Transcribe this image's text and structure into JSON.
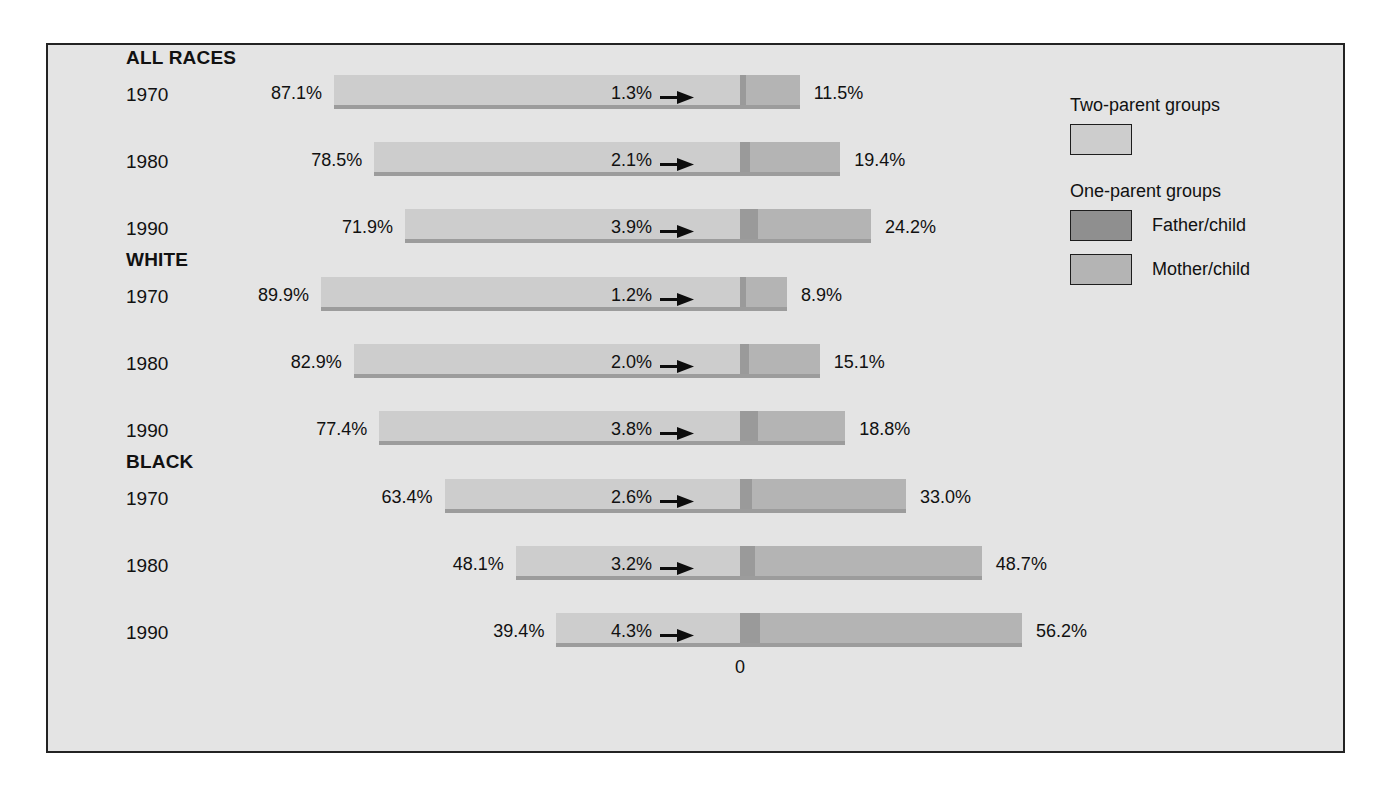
{
  "chart_data": {
    "type": "bar",
    "subtype": "diverging-stacked-horizontal",
    "title": "",
    "xlabel": "",
    "ylabel": "",
    "zero_axis_label": "0",
    "axis_origin_note": "Bars diverge from a common zero line; two-parent share extends left, one-parent share extends right.",
    "legend": {
      "position": "right",
      "groups": [
        {
          "title": "Two-parent groups",
          "entries": [
            {
              "label": "",
              "color": "#cdcdcd",
              "swatch_only": true
            }
          ]
        },
        {
          "title": "One-parent groups",
          "entries": [
            {
              "label": "Father/child",
              "color": "#8f8f8f"
            },
            {
              "label": "Mother/child",
              "color": "#b4b4b4"
            }
          ]
        }
      ]
    },
    "colors": {
      "two_parent": "#cdcdcd",
      "father_child": "#9a9a9a",
      "mother_child": "#b4b4b4",
      "background": "#e4e4e4",
      "frame": "#232323",
      "text": "#111111",
      "bar_shadow": "#9c9c9c"
    },
    "series": [
      {
        "name": "Two-parent groups",
        "color": "#cdcdcd"
      },
      {
        "name": "Father/child",
        "color": "#9a9a9a"
      },
      {
        "name": "Mother/child",
        "color": "#b4b4b4"
      }
    ],
    "groups": [
      {
        "name": "ALL RACES",
        "rows": [
          {
            "year": "1970",
            "two_parent": 87.1,
            "father_child": 1.3,
            "mother_child": 11.5,
            "two_parent_label": "87.1%",
            "father_child_label": "1.3%",
            "mother_child_label": "11.5%"
          },
          {
            "year": "1980",
            "two_parent": 78.5,
            "father_child": 2.1,
            "mother_child": 19.4,
            "two_parent_label": "78.5%",
            "father_child_label": "2.1%",
            "mother_child_label": "19.4%"
          },
          {
            "year": "1990",
            "two_parent": 71.9,
            "father_child": 3.9,
            "mother_child": 24.2,
            "two_parent_label": "71.9%",
            "father_child_label": "3.9%",
            "mother_child_label": "24.2%"
          }
        ]
      },
      {
        "name": "WHITE",
        "rows": [
          {
            "year": "1970",
            "two_parent": 89.9,
            "father_child": 1.2,
            "mother_child": 8.9,
            "two_parent_label": "89.9%",
            "father_child_label": "1.2%",
            "mother_child_label": "8.9%"
          },
          {
            "year": "1980",
            "two_parent": 82.9,
            "father_child": 2.0,
            "mother_child": 15.1,
            "two_parent_label": "82.9%",
            "father_child_label": "2.0%",
            "mother_child_label": "15.1%"
          },
          {
            "year": "1990",
            "two_parent": 77.4,
            "father_child": 3.8,
            "mother_child": 18.8,
            "two_parent_label": "77.4%",
            "father_child_label": "3.8%",
            "mother_child_label": "18.8%"
          }
        ]
      },
      {
        "name": "BLACK",
        "rows": [
          {
            "year": "1970",
            "two_parent": 63.4,
            "father_child": 2.6,
            "mother_child": 33.0,
            "two_parent_label": "63.4%",
            "father_child_label": "2.6%",
            "mother_child_label": "33.0%"
          },
          {
            "year": "1980",
            "two_parent": 48.1,
            "father_child": 3.2,
            "mother_child": 48.7,
            "two_parent_label": "48.1%",
            "father_child_label": "3.2%",
            "mother_child_label": "48.7%"
          },
          {
            "year": "1990",
            "two_parent": 39.4,
            "father_child": 4.3,
            "mother_child": 56.2,
            "two_parent_label": "39.4%",
            "father_child_label": "4.3%",
            "mother_child_label": "56.2%"
          }
        ]
      }
    ]
  },
  "layout": {
    "zero_x": 692,
    "px_per_percent": 4.66,
    "bar_height": 30,
    "row_height": 40,
    "group_title_offset": -28,
    "group_tops": [
      30,
      232,
      434
    ],
    "row_gap": 67
  }
}
